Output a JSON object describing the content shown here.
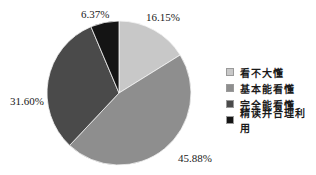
{
  "chart_data": {
    "type": "pie",
    "title": "",
    "categories": [
      "看不大懂",
      "基本能看懂",
      "完全能看懂",
      "精读并合理利用"
    ],
    "values": [
      16.15,
      45.88,
      31.6,
      6.37
    ],
    "labels": [
      "16.15%",
      "45.88%",
      "31.60%",
      "6.37%"
    ],
    "colors": [
      "#c8c8c8",
      "#8e8e8e",
      "#4a4a4a",
      "#141414"
    ],
    "start_angle": "12 o'clock",
    "direction": "clockwise",
    "legend_position": "right"
  },
  "legend": {
    "items": [
      {
        "label": "看不大懂",
        "color": "#c8c8c8"
      },
      {
        "label": "基本能看懂",
        "color": "#8e8e8e"
      },
      {
        "label": "完全能看懂",
        "color": "#4a4a4a"
      },
      {
        "label": "精读并合理利用",
        "color": "#141414"
      }
    ]
  },
  "slice_labels": {
    "s0": "16.15%",
    "s1": "45.88%",
    "s2": "31.60%",
    "s3": "6.37%"
  }
}
